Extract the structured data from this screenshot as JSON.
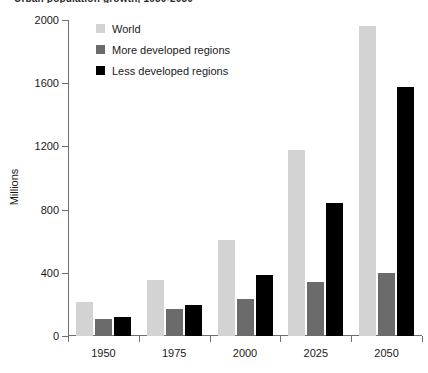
{
  "caption": {
    "text": "Urban population growth, 1950-2050"
  },
  "axis": {
    "ylabel": "Millions",
    "yticks": [
      "0",
      "400",
      "800",
      "1200",
      "1600",
      "2000"
    ],
    "xticks": [
      "1950",
      "1975",
      "2000",
      "2025",
      "2050"
    ]
  },
  "legend": {
    "position": "top-left-inside",
    "items": [
      {
        "label": "World",
        "color": "#d3d3d3",
        "key": "world"
      },
      {
        "label": "More developed regions",
        "color": "#6b6b6b",
        "key": "more"
      },
      {
        "label": "Less developed regions",
        "color": "#000000",
        "key": "less"
      }
    ]
  },
  "colors": {
    "world": "#d3d3d3",
    "more_developed": "#6b6b6b",
    "less_developed": "#000000",
    "axis": "#6f6f6f",
    "text": "#1a1a1a",
    "background": "#ffffff"
  },
  "chart_data": {
    "type": "bar",
    "title": "Urban population growth, 1950-2050",
    "xlabel": "",
    "ylabel": "Millions",
    "categories": [
      "1950",
      "1975",
      "2000",
      "2025",
      "2050"
    ],
    "series": [
      {
        "name": "World",
        "color": "#d3d3d3",
        "values": [
          215,
          355,
          610,
          1180,
          1960
        ]
      },
      {
        "name": "More developed regions",
        "color": "#6b6b6b",
        "values": [
          105,
          170,
          235,
          345,
          400
        ]
      },
      {
        "name": "Less developed regions",
        "color": "#000000",
        "values": [
          120,
          195,
          385,
          845,
          1575
        ]
      }
    ],
    "ylim": [
      0,
      2000
    ],
    "ytick_step": 400,
    "grid": false,
    "legend": true,
    "legend_position": "upper left"
  }
}
